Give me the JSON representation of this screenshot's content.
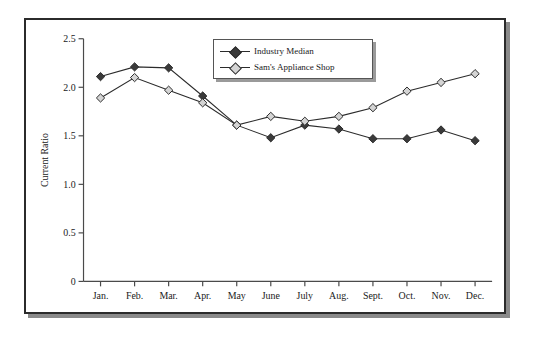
{
  "figure": {
    "frame_border_color": "#2b2b2b",
    "shadow_color": "#8a8a8a",
    "background": "#ffffff"
  },
  "legend": {
    "position": "top-center",
    "entries": [
      {
        "label": "Industry Median",
        "marker": "filled-diamond",
        "color": "#3a3a3a",
        "icon": "diamond-marker-icon"
      },
      {
        "label": "Sam's Appliance Shop",
        "marker": "open-diamond",
        "color": "#d4d4d4",
        "icon": "diamond-marker-icon"
      }
    ]
  },
  "chart_data": {
    "type": "line",
    "title": "",
    "xlabel": "",
    "ylabel": "Current Ratio",
    "ylim": [
      0,
      2.5
    ],
    "yticks": [
      "0",
      "0.5",
      "1.0",
      "1.5",
      "2.0",
      "2.5"
    ],
    "ytick_values": [
      0,
      0.5,
      1.0,
      1.5,
      2.0,
      2.5
    ],
    "grid": false,
    "legend_position": "top-center",
    "categories": [
      "Jan.",
      "Feb.",
      "Mar.",
      "Apr.",
      "May",
      "June",
      "July",
      "Aug.",
      "Sept.",
      "Oct.",
      "Nov.",
      "Dec."
    ],
    "series": [
      {
        "name": "Industry Median",
        "color": "#3a3a3a",
        "marker": "filled-diamond",
        "values": [
          2.11,
          2.21,
          2.2,
          1.91,
          1.61,
          1.48,
          1.61,
          1.57,
          1.47,
          1.47,
          1.56,
          1.45
        ]
      },
      {
        "name": "Sam's Appliance Shop",
        "color": "#d4d4d4",
        "marker": "open-diamond",
        "values": [
          1.89,
          2.1,
          1.97,
          1.84,
          1.61,
          1.7,
          1.65,
          1.7,
          1.79,
          1.96,
          2.05,
          2.14
        ]
      }
    ]
  }
}
